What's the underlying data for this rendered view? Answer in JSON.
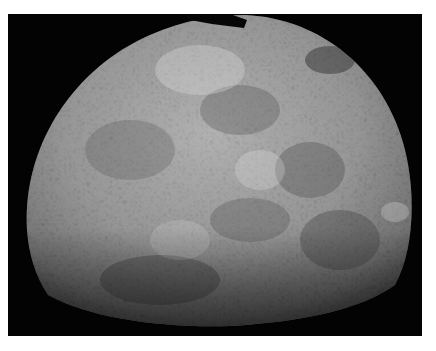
{
  "image": {
    "subject": "Mercury",
    "description": "Grayscale mosaic photograph of the cratered surface of the planet Mercury against a black background",
    "colors": {
      "page_background": "#ffffff",
      "space_background": "#030303",
      "surface_light": "#d8d8d8",
      "surface_mid": "#8a8a8a",
      "surface_dark": "#3a3a3a"
    }
  }
}
